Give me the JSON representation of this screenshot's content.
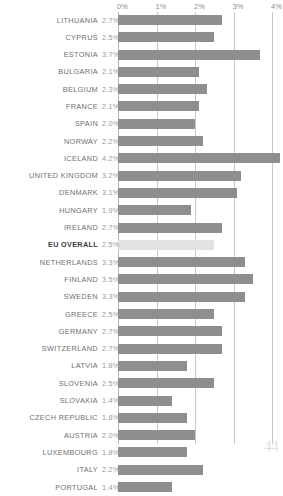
{
  "page": {
    "page_number": "44"
  },
  "chart_data": {
    "type": "bar",
    "orientation": "horizontal",
    "title": "",
    "xlabel": "",
    "ylabel": "",
    "xlim": [
      0,
      4
    ],
    "xtick_labels": [
      "0%",
      "1%",
      "2%",
      "3%",
      "4%"
    ],
    "xticks": [
      0,
      1,
      2,
      3,
      4
    ],
    "grid": true,
    "legend": "none",
    "value_suffix": "%",
    "highlight_category": "EU OVERALL",
    "colors": {
      "bar": "#8e8e8e",
      "bar_highlight": "#e2e2e2",
      "gridline": "#c8c8c8",
      "axis_zero": "#b4b4b4",
      "label_text": "#6f6f6f",
      "value_text": "#9a9a9a",
      "highlight_text": "#3c3c3c",
      "page_number": "#e0e0e0",
      "background": "#ffffff"
    },
    "categories": [
      "LITHUANIA",
      "CYPRUS",
      "ESTONIA",
      "BULGARIA",
      "BELGIUM",
      "FRANCE",
      "SPAIN",
      "NORWAY",
      "ICELAND",
      "UNITED KINGDOM",
      "DENMARK",
      "HUNGARY",
      "IRELAND",
      "EU OVERALL",
      "NETHERLANDS",
      "FINLAND",
      "SWEDEN",
      "GREECE",
      "GERMANY",
      "SWITZERLAND",
      "LATVIA",
      "SLOVENIA",
      "SLOVAKIA",
      "CZECH REPUBLIC",
      "AUSTRIA",
      "LUXEMBOURG",
      "ITALY",
      "PORTUGAL"
    ],
    "values": [
      2.7,
      2.5,
      3.7,
      2.1,
      2.3,
      2.1,
      2.0,
      2.2,
      4.2,
      3.2,
      3.1,
      1.9,
      2.7,
      2.5,
      3.3,
      3.5,
      3.3,
      2.5,
      2.7,
      2.7,
      1.8,
      2.5,
      1.4,
      1.8,
      2.0,
      1.8,
      2.2,
      1.4
    ],
    "value_labels": [
      "2.7%",
      "2.5%",
      "3.7%",
      "2.1%",
      "2.3%",
      "2.1%",
      "2.0%",
      "2.2%",
      "4.2%",
      "3.2%",
      "3.1%",
      "1.9%",
      "2.7%",
      "2.5%",
      "3.3%",
      "3.5%",
      "3.3%",
      "2.5%",
      "2.7%",
      "2.7%",
      "1.8%",
      "2.5%",
      "1.4%",
      "1.8%",
      "2.0%",
      "1.8%",
      "2.2%",
      "1.4%"
    ]
  }
}
